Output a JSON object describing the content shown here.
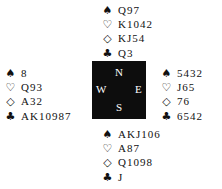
{
  "diagram": {
    "type": "bridge-deal",
    "compass": {
      "north": "N",
      "west": "W",
      "east": "E",
      "south": "S"
    },
    "suit_symbols": {
      "spades": "♠",
      "hearts": "♡",
      "diamonds": "◇",
      "clubs": "♣"
    },
    "hands": {
      "north": {
        "spades": "Q97",
        "hearts": "K1042",
        "diamonds": "KJ54",
        "clubs": "Q3"
      },
      "west": {
        "spades": "8",
        "hearts": "Q93",
        "diamonds": "A32",
        "clubs": "AK10987"
      },
      "east": {
        "spades": "5432",
        "hearts": "J65",
        "diamonds": "76",
        "clubs": "6542"
      },
      "south": {
        "spades": "AKJ106",
        "hearts": "A87",
        "diamonds": "Q1098",
        "clubs": "J"
      }
    }
  }
}
